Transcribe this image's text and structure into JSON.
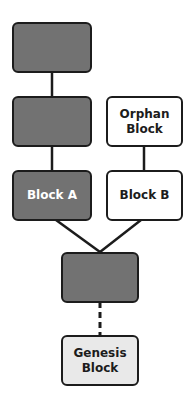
{
  "diagram": {
    "type": "blockchain-fork",
    "colors": {
      "dark_block": "#727272",
      "orphan_block": "#ffffff",
      "genesis_block": "#e9e9e9",
      "stroke": "#1c1c1c"
    },
    "blocks": [
      {
        "id": "top",
        "label": ""
      },
      {
        "id": "second",
        "label": ""
      },
      {
        "id": "block_a",
        "label": "Block A"
      },
      {
        "id": "orphan",
        "label": "Orphan\nBlock"
      },
      {
        "id": "block_b",
        "label": "Block B"
      },
      {
        "id": "merge",
        "label": ""
      },
      {
        "id": "genesis",
        "label": "Genesis\nBlock"
      }
    ],
    "labels": {
      "block_a": "Block A",
      "orphan_1": "Orphan",
      "orphan_2": "Block",
      "block_b": "Block B",
      "genesis_1": "Genesis",
      "genesis_2": "Block"
    },
    "edges": [
      {
        "from": "top",
        "to": "second",
        "style": "solid"
      },
      {
        "from": "second",
        "to": "block_a",
        "style": "solid"
      },
      {
        "from": "orphan",
        "to": "block_b",
        "style": "solid"
      },
      {
        "from": "block_a",
        "to": "merge",
        "style": "solid"
      },
      {
        "from": "block_b",
        "to": "merge",
        "style": "solid"
      },
      {
        "from": "merge",
        "to": "genesis",
        "style": "dashed"
      }
    ]
  }
}
